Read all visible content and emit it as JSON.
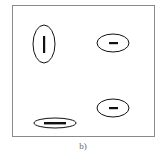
{
  "figure": {
    "caption": "b)",
    "frame_color": "#8a8a8a",
    "ink_color": "#111111",
    "shapes": [
      {
        "name": "vertical-ellipse",
        "cx": 44,
        "cy": 44,
        "rx": 11,
        "ry": 19,
        "bar": "vertical"
      },
      {
        "name": "top-right-ellipse",
        "cx": 113,
        "cy": 43,
        "rx": 16,
        "ry": 9,
        "bar": "horizontal-short"
      },
      {
        "name": "bottom-left-flat-ellipse",
        "cx": 55,
        "cy": 123,
        "rx": 21,
        "ry": 5,
        "bar": "horizontal-long"
      },
      {
        "name": "bottom-right-ellipse",
        "cx": 113,
        "cy": 108,
        "rx": 16,
        "ry": 9,
        "bar": "horizontal-short"
      }
    ]
  }
}
